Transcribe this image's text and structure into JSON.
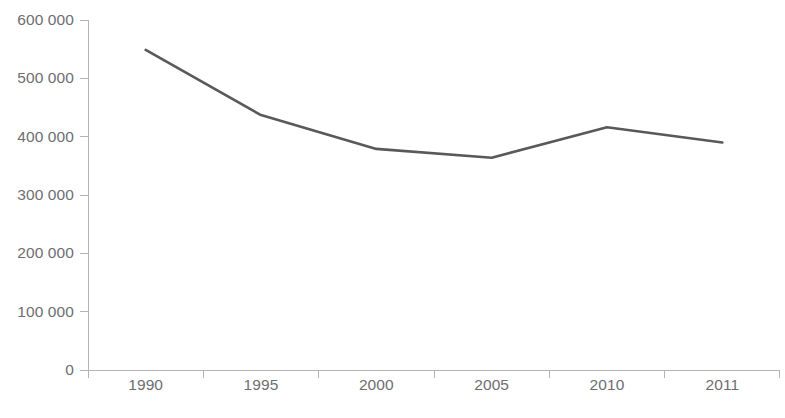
{
  "chart_data": {
    "type": "line",
    "title": "",
    "subtitle": "",
    "xlabel": "",
    "ylabel": "",
    "categories": [
      "1990",
      "1995",
      "2000",
      "2005",
      "2010",
      "2011"
    ],
    "series": [
      {
        "name": "series-1",
        "values": [
          549000,
          437000,
          379000,
          364000,
          416000,
          390000
        ],
        "color": "#58595b"
      }
    ],
    "ylim": [
      0,
      600000
    ],
    "ytick_values": [
      0,
      100000,
      200000,
      300000,
      400000,
      500000,
      600000
    ],
    "ytick_labels": [
      "0",
      "100 000",
      "200 000",
      "300 000",
      "400 000",
      "500 000",
      "600 000"
    ],
    "xtick_labels": [
      "1990",
      "1995",
      "2000",
      "2005",
      "2010",
      "2011"
    ],
    "grid": false,
    "legend": false,
    "legend_position": "none",
    "annotations": [],
    "axis_color": "#b4b4b4",
    "tick_label_color": "#6d6e71",
    "background_color": "#ffffff"
  }
}
